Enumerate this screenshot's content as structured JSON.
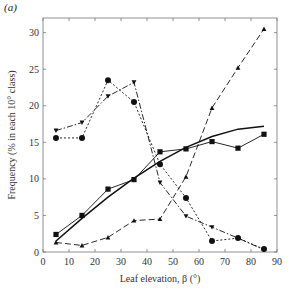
{
  "panel_label": "(a)",
  "chart_data": {
    "type": "line",
    "title": "",
    "xlabel": "Leaf elevation, β (°)",
    "ylabel": "Frequency (% in each 10° class)",
    "xlim": [
      0,
      90
    ],
    "ylim": [
      0,
      32
    ],
    "xticks": [
      0,
      10,
      20,
      30,
      40,
      50,
      60,
      70,
      80,
      90
    ],
    "yticks": [
      0,
      5,
      10,
      15,
      20,
      25,
      30
    ],
    "grid": false,
    "legend": null,
    "x": [
      5,
      15,
      25,
      35,
      45,
      55,
      65,
      75,
      85
    ],
    "series": [
      {
        "name": "squares",
        "marker": "square",
        "line": "solid-thin",
        "values": [
          2.4,
          5.0,
          8.6,
          9.9,
          13.7,
          14.1,
          15.1,
          14.2,
          16.1
        ]
      },
      {
        "name": "circles",
        "marker": "circle",
        "line": "dotted",
        "values": [
          15.6,
          15.6,
          23.5,
          20.5,
          12.0,
          7.4,
          1.5,
          1.9,
          0.4
        ]
      },
      {
        "name": "inverted-triangles",
        "marker": "triangle-down",
        "line": "dash-dot",
        "values": [
          16.6,
          17.7,
          21.3,
          23.2,
          9.5,
          4.9,
          3.4,
          1.9,
          0.3
        ]
      },
      {
        "name": "upright-triangles",
        "marker": "triangle-up",
        "line": "long-dash",
        "values": [
          1.3,
          0.9,
          2.0,
          4.3,
          4.5,
          10.3,
          19.7,
          25.2,
          30.5
        ]
      },
      {
        "name": "fitted-curve",
        "marker": "none",
        "line": "solid-thick",
        "x": [
          5,
          15,
          25,
          35,
          45,
          55,
          65,
          75,
          85
        ],
        "values": [
          1.5,
          4.6,
          7.5,
          10.1,
          12.4,
          14.3,
          15.8,
          16.8,
          17.2
        ]
      }
    ]
  }
}
